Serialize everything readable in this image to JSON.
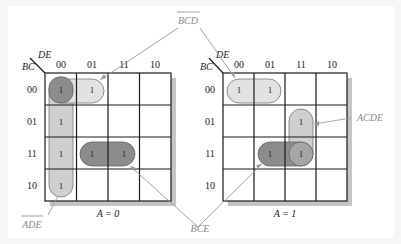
{
  "maps": [
    {
      "id": "left",
      "caption": "A = 0",
      "row_var": "BC",
      "col_var": "DE",
      "col_labels": [
        "00",
        "01",
        "11",
        "10"
      ],
      "row_labels": [
        "00",
        "01",
        "11",
        "10"
      ],
      "cells": [
        [
          "1",
          "1",
          "",
          ""
        ],
        [
          "1",
          "",
          "",
          ""
        ],
        [
          "1",
          "1",
          "1",
          ""
        ],
        [
          "1",
          "",
          "",
          ""
        ]
      ]
    },
    {
      "id": "right",
      "caption": "A = 1",
      "row_var": "BC",
      "col_var": "DE",
      "col_labels": [
        "00",
        "01",
        "11",
        "10"
      ],
      "row_labels": [
        "00",
        "01",
        "11",
        "10"
      ],
      "cells": [
        [
          "1",
          "1",
          "",
          ""
        ],
        [
          "",
          "",
          "1",
          ""
        ],
        [
          "",
          "1",
          "1",
          ""
        ],
        [
          "",
          "",
          "",
          ""
        ]
      ]
    }
  ],
  "terms": {
    "bcd": "BCD",
    "ade": "ADE",
    "bce": "BCE",
    "acde": "ACDE"
  },
  "colors": {
    "grid": "#1a1a1a",
    "shadow": "#c4c4c4",
    "loop_dark": "#8c8c8c",
    "loop_light": "#cfcfcf",
    "leader": "#9a9a9a",
    "label": "#8a8a8a"
  }
}
